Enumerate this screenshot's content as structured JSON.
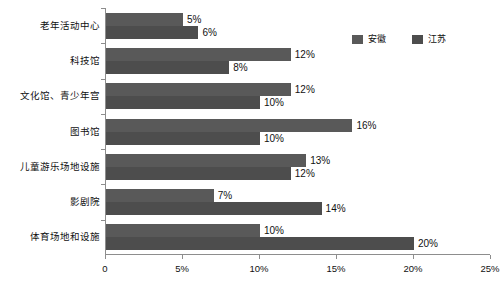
{
  "chart_data": {
    "type": "bar",
    "orientation": "horizontal",
    "title": "",
    "xlabel": "",
    "ylabel": "",
    "xlim": [
      0,
      25
    ],
    "grid": false,
    "legend_position": "top-right",
    "xticks": [
      "0",
      "5%",
      "10%",
      "15%",
      "20%",
      "25%"
    ],
    "xtick_values": [
      0,
      5,
      10,
      15,
      20,
      25
    ],
    "categories": [
      "老年活动中心",
      "科技馆",
      "文化馆、青少年宫",
      "图书馆",
      "儿童游乐场地设施",
      "影剧院",
      "体育场地和设施"
    ],
    "series": [
      {
        "name": "安徽",
        "color": "#595959",
        "values": [
          5,
          12,
          12,
          16,
          13,
          7,
          10
        ],
        "labels": [
          "5%",
          "12%",
          "12%",
          "16%",
          "13%",
          "7%",
          "10%"
        ]
      },
      {
        "name": "江苏",
        "color": "#4d4d4d",
        "values": [
          6,
          8,
          10,
          10,
          12,
          14,
          20
        ],
        "labels": [
          "6%",
          "8%",
          "10%",
          "10%",
          "12%",
          "14%",
          "20%"
        ]
      }
    ]
  },
  "legend": {
    "items": [
      {
        "label": "安徽",
        "color": "#595959"
      },
      {
        "label": "江苏",
        "color": "#4d4d4d"
      }
    ]
  }
}
